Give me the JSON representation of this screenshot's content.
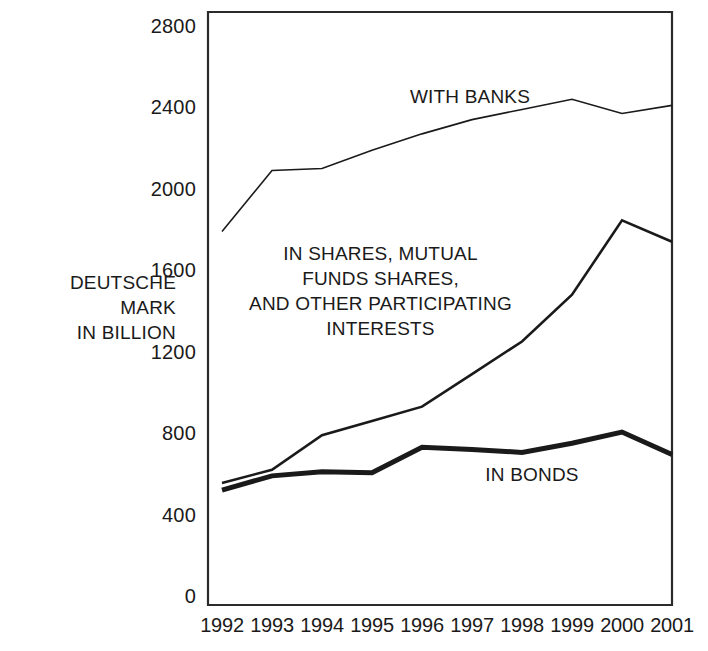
{
  "axis_title": "DEUTSCHE\nMARK\nIN BILLION",
  "labels": {
    "banks": "WITH BANKS",
    "shares": "IN SHARES, MUTUAL\nFUNDS SHARES,\nAND OTHER PARTICIPATING\nINTERESTS",
    "bonds": "IN BONDS"
  },
  "chart_data": {
    "type": "line",
    "title": "",
    "xlabel": "",
    "ylabel": "DEUTSCHE MARK IN BILLION",
    "x": [
      1992,
      1993,
      1994,
      1995,
      1996,
      1997,
      1998,
      1999,
      2000,
      2001
    ],
    "xtick_labels": [
      "1992",
      "1993",
      "1994",
      "1995",
      "1996",
      "1997",
      "1998",
      "1999",
      "2000",
      "2001"
    ],
    "ytick_labels": [
      "2800",
      "2400",
      "2000",
      "1600",
      "1200",
      "800",
      "400",
      "0"
    ],
    "yticks": [
      2800,
      2400,
      2000,
      1600,
      1200,
      800,
      400,
      0
    ],
    "ylim": [
      0,
      2800
    ],
    "xlim": [
      1992,
      2001
    ],
    "grid": false,
    "legend_position": "inline-annotations",
    "series": [
      {
        "name": "WITH BANKS",
        "line_width": 1.6,
        "color": "#1a1a1a",
        "values": [
          1800,
          2100,
          2110,
          2200,
          2280,
          2350,
          2400,
          2450,
          2380,
          2420
        ]
      },
      {
        "name": "IN SHARES, MUTUAL FUNDS SHARES, AND OTHER PARTICIPATING INTERESTS",
        "line_width": 2.6,
        "color": "#1a1a1a",
        "values": [
          565,
          630,
          800,
          870,
          940,
          1100,
          1260,
          1490,
          1855,
          1750
        ]
      },
      {
        "name": "IN BONDS",
        "line_width": 5.0,
        "color": "#1a1a1a",
        "values": [
          530,
          600,
          620,
          615,
          740,
          730,
          715,
          760,
          815,
          705
        ]
      }
    ]
  }
}
